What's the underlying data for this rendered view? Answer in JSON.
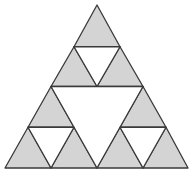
{
  "diagram": {
    "type": "sierpinski-triangle",
    "iterations": 2,
    "fill_color": "#d4d4d4",
    "hole_color": "#ffffff",
    "stroke_color": "#3a3a3a",
    "outer": {
      "apex": [
        97,
        5
      ],
      "left": [
        5,
        168
      ],
      "right": [
        188,
        168
      ]
    },
    "filled_triangles": [
      [
        [
          97,
          5
        ],
        [
          74,
          46.75
        ],
        [
          120,
          46.75
        ]
      ],
      [
        [
          74,
          46.75
        ],
        [
          51,
          86.5
        ],
        [
          97,
          86.5
        ]
      ],
      [
        [
          120,
          46.75
        ],
        [
          97,
          86.5
        ],
        [
          143,
          86.5
        ]
      ],
      [
        [
          51,
          86.5
        ],
        [
          28,
          127.25
        ],
        [
          74,
          127.25
        ]
      ],
      [
        [
          28,
          127.25
        ],
        [
          5,
          168
        ],
        [
          51,
          168
        ]
      ],
      [
        [
          74,
          127.25
        ],
        [
          51,
          168
        ],
        [
          97,
          168
        ]
      ],
      [
        [
          143,
          86.5
        ],
        [
          120,
          127.25
        ],
        [
          166,
          127.25
        ]
      ],
      [
        [
          120,
          127.25
        ],
        [
          97,
          168
        ],
        [
          143,
          168
        ]
      ],
      [
        [
          166,
          127.25
        ],
        [
          143,
          168
        ],
        [
          188,
          168
        ]
      ]
    ],
    "holes": [
      [
        [
          74,
          46.75
        ],
        [
          120,
          46.75
        ],
        [
          97,
          86.5
        ]
      ],
      [
        [
          51,
          86.5
        ],
        [
          143,
          86.5
        ],
        [
          97,
          168
        ]
      ],
      [
        [
          28,
          127.25
        ],
        [
          74,
          127.25
        ],
        [
          51,
          168
        ]
      ],
      [
        [
          120,
          127.25
        ],
        [
          166,
          127.25
        ],
        [
          143,
          168
        ]
      ]
    ]
  }
}
